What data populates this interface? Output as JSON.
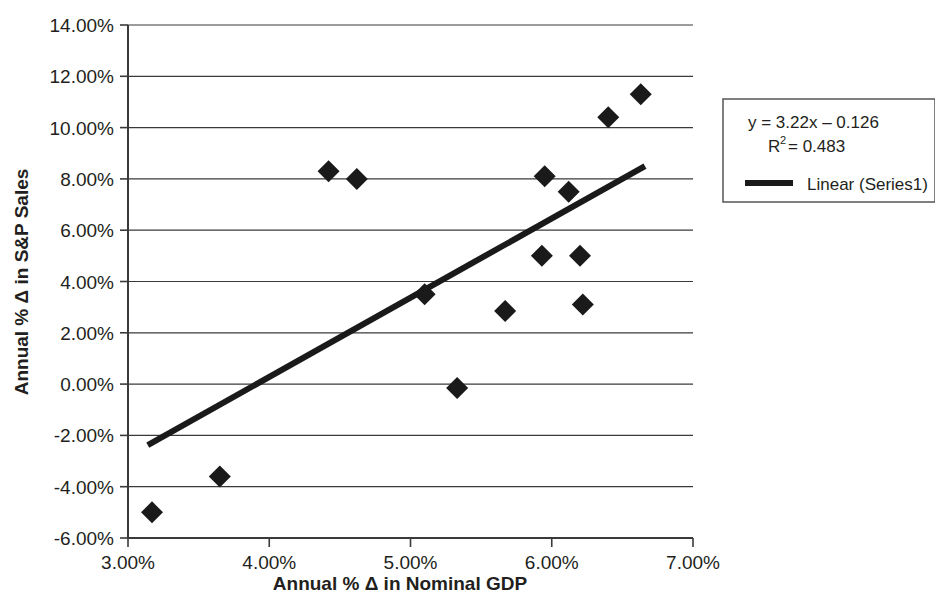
{
  "chart_data": {
    "type": "scatter",
    "title": "",
    "xlabel": "Annual % Δ in Nominal GDP",
    "ylabel": "Annual % Δ in S&P Sales",
    "xlim": [
      3.0,
      7.0
    ],
    "ylim": [
      -6.0,
      14.0
    ],
    "xtick_labels": [
      "3.00%",
      "4.00%",
      "5.00%",
      "6.00%",
      "7.00%"
    ],
    "xtick_values": [
      3.0,
      4.0,
      5.0,
      6.0,
      7.0
    ],
    "ytick_labels": [
      "14.00%",
      "12.00%",
      "10.00%",
      "8.00%",
      "6.00%",
      "4.00%",
      "2.00%",
      "0.00%",
      "-2.00%",
      "-4.00%",
      "-6.00%"
    ],
    "ytick_values": [
      14.0,
      12.0,
      10.0,
      8.0,
      6.0,
      4.0,
      2.0,
      0.0,
      -2.0,
      -4.0,
      -6.0
    ],
    "grid": "horizontal",
    "legend_position": "right",
    "marker": "diamond",
    "marker_color": "#1a1a1a",
    "trendline_color": "#1a1a1a",
    "series": [
      {
        "name": "Series1",
        "points": [
          {
            "x": 3.17,
            "y": -5.0
          },
          {
            "x": 3.65,
            "y": -3.6
          },
          {
            "x": 4.42,
            "y": 8.3
          },
          {
            "x": 4.62,
            "y": 8.0
          },
          {
            "x": 5.1,
            "y": 3.5
          },
          {
            "x": 5.33,
            "y": -0.15
          },
          {
            "x": 5.67,
            "y": 2.85
          },
          {
            "x": 5.93,
            "y": 5.0
          },
          {
            "x": 5.95,
            "y": 8.1
          },
          {
            "x": 6.12,
            "y": 7.5
          },
          {
            "x": 6.2,
            "y": 5.0
          },
          {
            "x": 6.22,
            "y": 3.1
          },
          {
            "x": 6.4,
            "y": 10.4
          },
          {
            "x": 6.63,
            "y": 11.3
          }
        ]
      }
    ],
    "trendline": {
      "name": "Linear (Series1)",
      "x_start": 3.14,
      "y_start": -2.38,
      "x_end": 6.66,
      "y_end": 8.5,
      "slope": 3.22,
      "intercept": -0.126
    },
    "annotations": {
      "equation": "y = 3.22x – 0.126",
      "r_squared_base": "R",
      "r_squared_exp": "2",
      "r_squared_value": "= 0.483"
    }
  },
  "legend": {
    "equation": "y = 3.22x – 0.126",
    "r2_base": "R",
    "r2_exp": "2",
    "r2_rest": "= 0.483",
    "series_label": "Linear (Series1)"
  },
  "axes": {
    "x_title": "Annual % Δ in Nominal GDP",
    "y_title": "Annual % Δ in S&P Sales",
    "x_ticks": [
      "3.00%",
      "4.00%",
      "5.00%",
      "6.00%",
      "7.00%"
    ],
    "y_ticks": [
      "14.00%",
      "12.00%",
      "10.00%",
      "8.00%",
      "6.00%",
      "4.00%",
      "2.00%",
      "0.00%",
      "-2.00%",
      "-4.00%",
      "-6.00%"
    ]
  }
}
